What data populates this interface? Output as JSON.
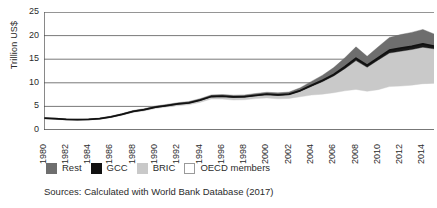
{
  "chart_data": {
    "type": "area",
    "title": "",
    "subtitle": "",
    "xlabel": "",
    "ylabel": "Trillion US$",
    "xlim": [
      1980,
      2015
    ],
    "ylim": [
      0,
      25
    ],
    "yticks": [
      0,
      5,
      10,
      15,
      20,
      25
    ],
    "xticks": [
      1980,
      1982,
      1984,
      1986,
      1988,
      1990,
      1992,
      1994,
      1996,
      1998,
      2000,
      2002,
      2004,
      2006,
      2008,
      2010,
      2012,
      2014
    ],
    "grid": "horizontal",
    "legend_position": "below-plot",
    "stacked": true,
    "stack_order_bottom_to_top": [
      "OECD members",
      "BRIC",
      "GCC",
      "Rest"
    ],
    "x": [
      1980,
      1981,
      1982,
      1983,
      1984,
      1985,
      1986,
      1987,
      1988,
      1989,
      1990,
      1991,
      1992,
      1993,
      1994,
      1995,
      1996,
      1997,
      1998,
      1999,
      2000,
      2001,
      2002,
      2003,
      2004,
      2005,
      2006,
      2007,
      2008,
      2009,
      2010,
      2011,
      2012,
      2013,
      2014,
      2015
    ],
    "series": [
      {
        "name": "OECD members",
        "color": "#ffffff",
        "values": [
          2.35,
          2.25,
          2.1,
          2.05,
          2.1,
          2.25,
          2.6,
          3.1,
          3.7,
          4.05,
          4.55,
          4.85,
          5.15,
          5.35,
          5.85,
          6.55,
          6.55,
          6.35,
          6.4,
          6.65,
          6.8,
          6.6,
          6.7,
          7.05,
          7.4,
          7.6,
          7.9,
          8.3,
          8.6,
          8.2,
          8.55,
          9.2,
          9.3,
          9.5,
          9.8,
          9.9
        ]
      },
      {
        "name": "BRIC",
        "color": "#c9c9c9",
        "values": [
          0.1,
          0.1,
          0.1,
          0.1,
          0.1,
          0.12,
          0.14,
          0.16,
          0.18,
          0.2,
          0.22,
          0.25,
          0.28,
          0.32,
          0.38,
          0.45,
          0.5,
          0.55,
          0.55,
          0.58,
          0.65,
          0.7,
          0.75,
          1.15,
          1.85,
          2.65,
          3.55,
          4.7,
          6.1,
          5.1,
          6.3,
          7.1,
          7.4,
          7.55,
          7.75,
          7.3
        ]
      },
      {
        "name": "GCC",
        "color": "#1a1a1a",
        "values": [
          0.05,
          0.05,
          0.05,
          0.05,
          0.05,
          0.05,
          0.05,
          0.06,
          0.06,
          0.07,
          0.08,
          0.08,
          0.09,
          0.09,
          0.1,
          0.1,
          0.11,
          0.11,
          0.11,
          0.12,
          0.13,
          0.13,
          0.14,
          0.16,
          0.2,
          0.26,
          0.32,
          0.4,
          0.52,
          0.4,
          0.48,
          0.6,
          0.66,
          0.68,
          0.7,
          0.55
        ]
      },
      {
        "name": "Rest",
        "color": "#6e6e6e",
        "values": [
          0.1,
          0.1,
          0.1,
          0.1,
          0.1,
          0.12,
          0.14,
          0.16,
          0.18,
          0.2,
          0.22,
          0.24,
          0.26,
          0.28,
          0.3,
          0.32,
          0.34,
          0.36,
          0.36,
          0.38,
          0.42,
          0.44,
          0.46,
          0.6,
          0.85,
          1.1,
          1.45,
          1.9,
          2.4,
          1.9,
          2.3,
          2.7,
          2.85,
          2.95,
          3.05,
          2.6
        ]
      }
    ],
    "cumulative_top_values": [
      2.6,
      2.5,
      2.35,
      2.3,
      2.35,
      2.54,
      2.93,
      3.48,
      4.12,
      4.52,
      5.07,
      5.42,
      5.78,
      6.04,
      6.63,
      7.42,
      7.5,
      7.37,
      7.42,
      7.73,
      8.0,
      7.87,
      8.05,
      8.96,
      10.3,
      11.61,
      13.22,
      15.3,
      17.62,
      15.6,
      17.63,
      19.6,
      20.21,
      20.68,
      21.3,
      20.35
    ]
  },
  "axis": {
    "ylabel": "Trillion US$",
    "ytick_labels": [
      "25",
      "20",
      "15",
      "10",
      "5",
      "0"
    ],
    "xtick_labels": [
      "1980",
      "1982",
      "1984",
      "1986",
      "1988",
      "1990",
      "1992",
      "1994",
      "1996",
      "1998",
      "2000",
      "2002",
      "2004",
      "2006",
      "2008",
      "2010",
      "2012",
      "2014"
    ]
  },
  "legend": {
    "items": [
      {
        "label": "Rest",
        "color": "#6e6e6e",
        "border": "#6e6e6e"
      },
      {
        "label": "GCC",
        "color": "#111111",
        "border": "#111111"
      },
      {
        "label": "BRIC",
        "color": "#c9c9c9",
        "border": "#c9c9c9"
      },
      {
        "label": "OECD members",
        "color": "#ffffff",
        "border": "#9a9a9a"
      }
    ]
  },
  "source": {
    "text": "Sources: Calculated with World Bank Database (2017)"
  },
  "colors": {
    "axis": "#4a4a4a",
    "grid": "#6a6a6a",
    "text": "#2b2b2b",
    "background": "#ffffff"
  }
}
